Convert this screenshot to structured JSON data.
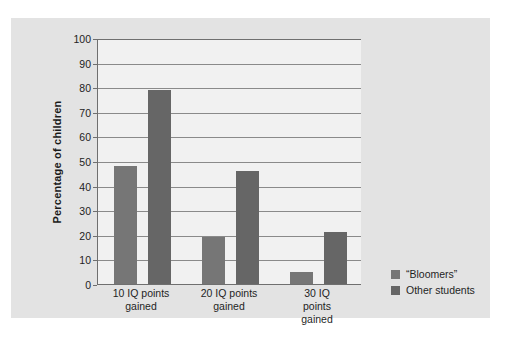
{
  "chart_data": {
    "type": "bar",
    "title": "",
    "subtitle": "",
    "xlabel": "",
    "ylabel": "Percentage of children",
    "categories": [
      "10 IQ points\ngained",
      "20 IQ points\ngained",
      "30 IQ points\ngained"
    ],
    "series": [
      {
        "name": "“Bloomers”",
        "values": [
          48,
          19,
          5
        ],
        "color": "#767676"
      },
      {
        "name": "Other students",
        "values": [
          79,
          46,
          21
        ],
        "color": "#666666"
      }
    ],
    "ylim": [
      0,
      100
    ],
    "yticks": [
      0,
      10,
      20,
      30,
      40,
      50,
      60,
      70,
      80,
      90,
      100
    ],
    "ytick_labels": [
      "0",
      "10",
      "20",
      "30",
      "40",
      "50",
      "60",
      "70",
      "80",
      "90",
      "100"
    ],
    "grid": true,
    "grid_axis": "y",
    "legend_position": "right",
    "panel_background": "#e3e3e3",
    "plot_background": "#f1f1f1",
    "axis_color": "#6f6f6f",
    "grid_color": "#8a8a8a",
    "text_color": "#1f1f1f"
  },
  "legend": {
    "entries": [
      {
        "label": "“Bloomers”"
      },
      {
        "label": "Other students"
      }
    ]
  }
}
